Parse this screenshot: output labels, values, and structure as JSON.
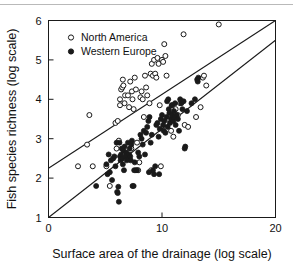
{
  "chart_data": {
    "type": "scatter",
    "title": "",
    "xlabel": "Surface area of the drainage (log scale)",
    "ylabel": "Fish species richness (log scale)",
    "xlim": [
      0,
      20
    ],
    "ylim": [
      1,
      6
    ],
    "xticks": [
      0,
      10,
      20
    ],
    "yticks": [
      1,
      2,
      3,
      4,
      5,
      6
    ],
    "xtick_labels": [
      "0",
      "10",
      "20"
    ],
    "ytick_labels": [
      "1",
      "2",
      "3",
      "4",
      "5",
      "6"
    ],
    "grid": false,
    "legend_position": "top-left",
    "legend": [
      {
        "name": "North America",
        "marker": "open-circle"
      },
      {
        "name": "Western Europe",
        "marker": "filled-circle"
      }
    ],
    "series": [
      {
        "name": "North America",
        "marker": "open-circle",
        "color": "#ffffff",
        "edge_color": "#1a1a1a",
        "points": [
          [
            2.6,
            2.3
          ],
          [
            3.4,
            2.85
          ],
          [
            3.9,
            2.3
          ],
          [
            3.6,
            3.6
          ],
          [
            5.1,
            2.3
          ],
          [
            5.4,
            1.8
          ],
          [
            5.9,
            3.4
          ],
          [
            6.1,
            3.45
          ],
          [
            6.3,
            4.0
          ],
          [
            6.3,
            3.85
          ],
          [
            6.4,
            4.25
          ],
          [
            6.5,
            4.3
          ],
          [
            6.55,
            4.5
          ],
          [
            6.6,
            4.35
          ],
          [
            6.7,
            3.9
          ],
          [
            6.75,
            4.1
          ],
          [
            6.2,
            2.95
          ],
          [
            6.0,
            2.75
          ],
          [
            6.6,
            2.6
          ],
          [
            6.9,
            2.6
          ],
          [
            7.0,
            4.1
          ],
          [
            7.1,
            3.8
          ],
          [
            7.2,
            4.45
          ],
          [
            7.35,
            4.2
          ],
          [
            7.4,
            4.0
          ],
          [
            7.5,
            3.75
          ],
          [
            7.6,
            4.55
          ],
          [
            7.7,
            4.25
          ],
          [
            7.8,
            2.9
          ],
          [
            7.9,
            2.2
          ],
          [
            8.1,
            4.05
          ],
          [
            8.2,
            4.2
          ],
          [
            8.3,
            4.0
          ],
          [
            8.4,
            3.55
          ],
          [
            8.5,
            4.6
          ],
          [
            8.6,
            4.3
          ],
          [
            8.7,
            4.1
          ],
          [
            8.9,
            3.9
          ],
          [
            9.0,
            4.65
          ],
          [
            9.1,
            4.9
          ],
          [
            9.2,
            4.6
          ],
          [
            9.3,
            5.0
          ],
          [
            9.4,
            4.65
          ],
          [
            9.5,
            4.55
          ],
          [
            9.6,
            5.05
          ],
          [
            9.7,
            4.9
          ],
          [
            9.8,
            3.85
          ],
          [
            9.9,
            2.3
          ],
          [
            10.0,
            5.0
          ],
          [
            10.1,
            4.95
          ],
          [
            10.2,
            5.4
          ],
          [
            10.3,
            5.1
          ],
          [
            10.4,
            4.6
          ],
          [
            10.6,
            3.5
          ],
          [
            10.8,
            3.2
          ],
          [
            11.0,
            3.05
          ],
          [
            11.2,
            3.75
          ],
          [
            11.4,
            3.6
          ],
          [
            11.6,
            3.9
          ],
          [
            11.9,
            5.65
          ],
          [
            12.0,
            3.35
          ],
          [
            12.3,
            3.3
          ],
          [
            13.0,
            3.55
          ],
          [
            13.4,
            3.8
          ],
          [
            13.6,
            4.55
          ],
          [
            13.7,
            4.6
          ],
          [
            13.9,
            4.35
          ],
          [
            15.0,
            5.9
          ],
          [
            7.3,
            2.75
          ],
          [
            8.0,
            2.4
          ],
          [
            9.05,
            2.2
          ],
          [
            10.9,
            3.85
          ]
        ]
      },
      {
        "name": "Western Europe",
        "marker": "filled-circle",
        "color": "#1a1a1a",
        "edge_color": "#1a1a1a",
        "points": [
          [
            4.2,
            1.8
          ],
          [
            5.1,
            2.35
          ],
          [
            5.2,
            2.1
          ],
          [
            5.3,
            2.6
          ],
          [
            5.4,
            2.15
          ],
          [
            5.5,
            2.45
          ],
          [
            5.6,
            1.95
          ],
          [
            5.7,
            2.5
          ],
          [
            5.8,
            2.55
          ],
          [
            5.9,
            2.3
          ],
          [
            6.0,
            2.9
          ],
          [
            6.05,
            1.65
          ],
          [
            6.1,
            1.62
          ],
          [
            6.15,
            1.78
          ],
          [
            6.2,
            1.4
          ],
          [
            6.3,
            2.55
          ],
          [
            6.35,
            2.45
          ],
          [
            6.4,
            2.6
          ],
          [
            6.45,
            2.75
          ],
          [
            6.5,
            2.5
          ],
          [
            6.55,
            2.35
          ],
          [
            6.6,
            2.7
          ],
          [
            6.65,
            2.2
          ],
          [
            6.7,
            2.8
          ],
          [
            6.8,
            2.55
          ],
          [
            6.85,
            2.65
          ],
          [
            6.9,
            2.45
          ],
          [
            7.0,
            2.9
          ],
          [
            7.05,
            2.5
          ],
          [
            7.1,
            2.6
          ],
          [
            7.15,
            2.75
          ],
          [
            7.2,
            2.55
          ],
          [
            7.25,
            2.45
          ],
          [
            7.3,
            2.85
          ],
          [
            7.35,
            2.95
          ],
          [
            7.4,
            1.8
          ],
          [
            7.5,
            1.8
          ],
          [
            7.6,
            2.4
          ],
          [
            7.7,
            2.2
          ],
          [
            7.8,
            2.2
          ],
          [
            7.9,
            2.65
          ],
          [
            8.0,
            2.55
          ],
          [
            8.1,
            3.1
          ],
          [
            8.2,
            3.0
          ],
          [
            8.3,
            2.85
          ],
          [
            8.4,
            3.2
          ],
          [
            8.5,
            2.6
          ],
          [
            8.6,
            3.15
          ],
          [
            8.7,
            3.3
          ],
          [
            8.8,
            3.45
          ],
          [
            8.9,
            3.55
          ],
          [
            9.0,
            2.9
          ],
          [
            9.1,
            3.1
          ],
          [
            9.2,
            2.2
          ],
          [
            9.3,
            2.1
          ],
          [
            9.4,
            2.3
          ],
          [
            9.5,
            3.35
          ],
          [
            9.6,
            3.4
          ],
          [
            9.7,
            3.05
          ],
          [
            9.8,
            3.25
          ],
          [
            9.9,
            3.5
          ],
          [
            10.0,
            3.6
          ],
          [
            10.1,
            3.35
          ],
          [
            10.15,
            3.2
          ],
          [
            10.2,
            3.45
          ],
          [
            10.3,
            3.15
          ],
          [
            10.4,
            3.55
          ],
          [
            10.5,
            3.3
          ],
          [
            10.6,
            3.75
          ],
          [
            10.65,
            3.65
          ],
          [
            10.7,
            3.4
          ],
          [
            10.8,
            3.5
          ],
          [
            10.85,
            3.85
          ],
          [
            10.9,
            3.6
          ],
          [
            11.0,
            3.45
          ],
          [
            11.05,
            3.7
          ],
          [
            11.1,
            3.55
          ],
          [
            11.15,
            3.9
          ],
          [
            11.2,
            3.35
          ],
          [
            11.3,
            3.6
          ],
          [
            11.4,
            3.5
          ],
          [
            11.5,
            3.2
          ],
          [
            11.6,
            4.0
          ],
          [
            11.7,
            3.9
          ],
          [
            11.8,
            3.75
          ],
          [
            12.0,
            2.75
          ],
          [
            12.05,
            2.8
          ],
          [
            12.2,
            3.7
          ],
          [
            10.55,
            4.0
          ],
          [
            10.45,
            3.95
          ],
          [
            11.9,
            3.95
          ],
          [
            12.6,
            3.9
          ],
          [
            12.9,
            4.0
          ],
          [
            13.1,
            4.5
          ],
          [
            13.15,
            4.45
          ],
          [
            13.2,
            4.55
          ],
          [
            8.85,
            2.15
          ],
          [
            9.75,
            2.1
          ],
          [
            7.55,
            2.2
          ],
          [
            6.25,
            2.9
          ]
        ]
      }
    ],
    "trend_lines": [
      {
        "name": "north-america-regression",
        "x1": 0,
        "y1": 2.25,
        "x2": 20,
        "y2": 6.0,
        "color": "#1a1a1a"
      },
      {
        "name": "western-europe-regression",
        "x1": 0,
        "y1": 1.0,
        "x2": 20,
        "y2": 5.5,
        "color": "#1a1a1a"
      }
    ]
  }
}
